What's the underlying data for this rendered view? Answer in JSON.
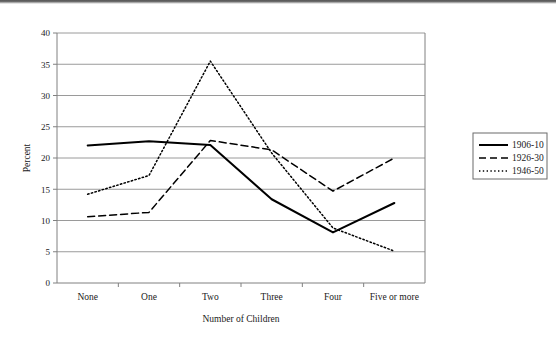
{
  "chart_data": {
    "type": "line",
    "title": "",
    "xlabel": "Number of Children",
    "ylabel": "Percent",
    "categories": [
      "None",
      "One",
      "Two",
      "Three",
      "Four",
      "Five or more"
    ],
    "ylim": [
      0,
      40
    ],
    "ytick_step": 5,
    "yticks": [
      "0",
      "5",
      "10",
      "15",
      "20",
      "25",
      "30",
      "35",
      "40"
    ],
    "grid": "horizontal",
    "legend_position": "right",
    "series": [
      {
        "name": "1906-10",
        "style": "solid",
        "color": "#000000",
        "values": [
          22.0,
          22.7,
          22.1,
          13.4,
          8.1,
          12.8
        ]
      },
      {
        "name": "1926-30",
        "style": "dashed",
        "color": "#000000",
        "values": [
          10.6,
          11.3,
          22.8,
          21.3,
          14.7,
          20.0
        ]
      },
      {
        "name": "1946-50",
        "style": "dotted",
        "color": "#000000",
        "values": [
          14.2,
          17.2,
          35.5,
          20.8,
          8.8,
          5.1
        ]
      }
    ]
  },
  "axis": {
    "x_title": "Number of Children",
    "y_title": "Percent"
  }
}
